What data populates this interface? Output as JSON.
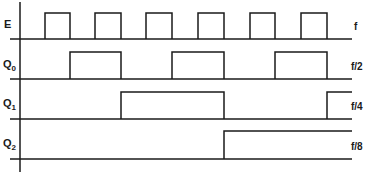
{
  "diagram": {
    "type": "timing-diagram",
    "signals": [
      {
        "name": "E",
        "sub": "",
        "freq": "f",
        "baseline_y": 39,
        "high_y": 13,
        "pulses": [
          [
            45,
            70
          ],
          [
            95,
            121
          ],
          [
            146,
            172
          ],
          [
            198,
            224
          ],
          [
            250,
            275
          ],
          [
            301,
            327
          ]
        ]
      },
      {
        "name": "Q",
        "sub": "0",
        "freq": "f/2",
        "baseline_y": 79,
        "high_y": 52,
        "pulses": [
          [
            70,
            121
          ],
          [
            172,
            224
          ],
          [
            275,
            327
          ]
        ]
      },
      {
        "name": "Q",
        "sub": "1",
        "freq": "f/4",
        "baseline_y": 119,
        "high_y": 92,
        "pulses": [
          [
            121,
            224
          ],
          [
            327,
            352
          ]
        ]
      },
      {
        "name": "Q",
        "sub": "2",
        "freq": "f/8",
        "baseline_y": 159,
        "high_y": 131,
        "pulses": [
          [
            224,
            352
          ]
        ]
      }
    ],
    "line_color": "#1a1a1a"
  }
}
